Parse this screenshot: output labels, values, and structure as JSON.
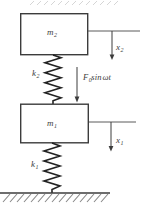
{
  "diagram": {
    "masses": {
      "top": {
        "symbol": "m",
        "sub": "2"
      },
      "bottom": {
        "symbol": "m",
        "sub": "1"
      }
    },
    "springs": {
      "top": {
        "symbol": "k",
        "sub": "2"
      },
      "bottom": {
        "symbol": "k",
        "sub": "1"
      }
    },
    "displacements": {
      "top": {
        "symbol": "x",
        "sub": "2"
      },
      "bottom": {
        "symbol": "x",
        "sub": "1"
      }
    },
    "force": {
      "symbol": "F",
      "sub": "0",
      "operator": "sin",
      "argument": "ωt"
    },
    "colors": {
      "line": "#3c3c3c",
      "thin_line": "#5a5a5a",
      "ground_hatch": "#8a8a8a",
      "faint_top_hatch": "#cccccc",
      "background": "#ffffff"
    }
  }
}
